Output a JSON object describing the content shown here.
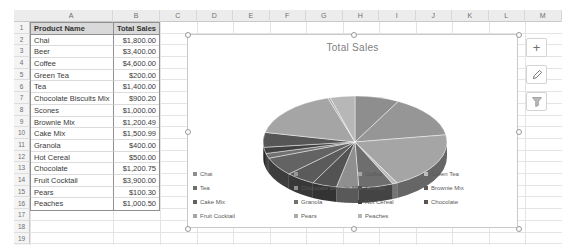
{
  "spreadsheet": {
    "column_letters": [
      "A",
      "B",
      "C",
      "D",
      "E",
      "F",
      "G",
      "H",
      "I",
      "J",
      "K",
      "L",
      "M"
    ],
    "row_numbers": [
      "1",
      "2",
      "3",
      "4",
      "5",
      "6",
      "7",
      "8",
      "9",
      "10",
      "11",
      "12",
      "13",
      "14",
      "15",
      "16",
      "17",
      "18",
      "19"
    ],
    "table": {
      "headers": [
        "Product Name",
        "Total Sales"
      ],
      "rows": [
        [
          "Chai",
          "$1,800.00"
        ],
        [
          "Beer",
          "$3,400.00"
        ],
        [
          "Coffee",
          "$4,600.00"
        ],
        [
          "Green Tea",
          "$200.00"
        ],
        [
          "Tea",
          "$1,400.00"
        ],
        [
          "Chocolate Biscuits Mix",
          "$900.20"
        ],
        [
          "Scones",
          "$1,000.00"
        ],
        [
          "Brownie Mix",
          "$1,200.49"
        ],
        [
          "Cake Mix",
          "$1,500.99"
        ],
        [
          "Granola",
          "$400.00"
        ],
        [
          "Hot Cereal",
          "$500.00"
        ],
        [
          "Chocolate",
          "$1,200.75"
        ],
        [
          "Fruit Cocktail",
          "$3,900.00"
        ],
        [
          "Pears",
          "$100.30"
        ],
        [
          "Peaches",
          "$1,000.50"
        ]
      ]
    }
  },
  "chart": {
    "title": "Total Sales",
    "buttons": {
      "plus_glyph": "+"
    }
  },
  "chart_data": {
    "type": "pie",
    "style": "3d",
    "title": "Total Sales",
    "legend_position": "bottom",
    "categories": [
      "Chai",
      "Beer",
      "Coffee",
      "Green Tea",
      "Tea",
      "Chocolate Biscuits Mix",
      "Scones",
      "Brownie Mix",
      "Cake Mix",
      "Granola",
      "Hot Cereal",
      "Chocolate",
      "Fruit Cocktail",
      "Pears",
      "Peaches"
    ],
    "values": [
      1800,
      3400,
      4600,
      200,
      1400,
      900.2,
      1000,
      1200.49,
      1500.99,
      400,
      500,
      1200.75,
      3900,
      100.3,
      1000.5
    ],
    "colors": [
      "#8E8E8E",
      "#969696",
      "#A5A5A5",
      "#BDBDBD",
      "#6E6E6E",
      "#8F8F8F",
      "#535353",
      "#5B5B5B",
      "#636363",
      "#717171",
      "#414141",
      "#565656",
      "#A5A5A5",
      "#ABABAB",
      "#B7B7B7"
    ]
  }
}
